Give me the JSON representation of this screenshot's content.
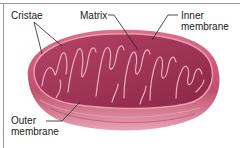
{
  "figure": {
    "colors": {
      "outer_membrane": "#c0506e",
      "outer_highlight": "#e48aa0",
      "matrix": "#9c2f52",
      "cristae_line": "#f2b8c8",
      "leader_line": "#222222",
      "frame": "#9a9a9a"
    }
  },
  "labels": {
    "cristae": "Cristae",
    "matrix": "Matrix",
    "inner_membrane_line1": "Inner",
    "inner_membrane_line2": "membrane",
    "outer_membrane_line1": "Outer",
    "outer_membrane_line2": "membrane"
  }
}
